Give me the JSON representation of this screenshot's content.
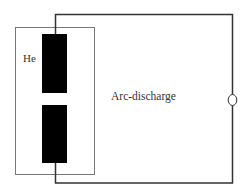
{
  "diagram": {
    "type": "schematic",
    "labels": {
      "chamber_gas": "He",
      "process": "Arc-discharge"
    },
    "components": [
      {
        "id": "chamber",
        "kind": "rectangle-outline"
      },
      {
        "id": "upper-electrode",
        "kind": "filled-rectangle"
      },
      {
        "id": "lower-electrode",
        "kind": "filled-rectangle"
      },
      {
        "id": "power-source",
        "kind": "circle"
      },
      {
        "id": "circuit-wire",
        "kind": "polyline"
      }
    ],
    "colors": {
      "electrode": "#000000",
      "wire": "#333333",
      "chamber_outline": "#777777",
      "text": "#333333",
      "background": "#ffffff"
    }
  }
}
